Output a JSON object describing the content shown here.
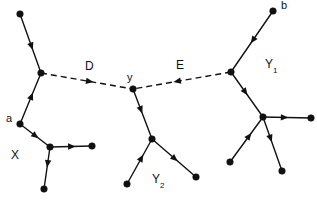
{
  "figure": {
    "type": "graph-diagram",
    "width": 317,
    "height": 202,
    "background_color": "#ffffff",
    "ink_color": "#111111"
  },
  "labels": {
    "bridge_d": "D",
    "bridge_e": "E",
    "node_y": "y",
    "node_a": "a",
    "node_b": "b",
    "region_x": "X",
    "region_y1_base": "Y",
    "region_y1_sub": "1",
    "region_y2_base": "Y",
    "region_y2_sub": "2"
  },
  "nodes": [
    {
      "id": "x_top",
      "name": "node-x-top",
      "x": 20,
      "y": 14
    },
    {
      "id": "x_junction",
      "name": "node-x-junction",
      "x": 41,
      "y": 73
    },
    {
      "id": "a",
      "name": "node-a",
      "x": 20,
      "y": 124
    },
    {
      "id": "x_hub",
      "name": "node-x-hub",
      "x": 50,
      "y": 147
    },
    {
      "id": "x_right",
      "name": "node-x-right",
      "x": 92,
      "y": 146
    },
    {
      "id": "x_bottom",
      "name": "node-x-bottom",
      "x": 44,
      "y": 189
    },
    {
      "id": "y",
      "name": "node-y",
      "x": 133,
      "y": 89
    },
    {
      "id": "y2_hub",
      "name": "node-y2-hub",
      "x": 152,
      "y": 139
    },
    {
      "id": "y2_left",
      "name": "node-y2-left",
      "x": 127,
      "y": 184
    },
    {
      "id": "y2_right",
      "name": "node-y2-right",
      "x": 196,
      "y": 177
    },
    {
      "id": "y1_junction",
      "name": "node-y1-junction",
      "x": 231,
      "y": 72
    },
    {
      "id": "b",
      "name": "node-b",
      "x": 273,
      "y": 11
    },
    {
      "id": "y1_hub",
      "name": "node-y1-hub",
      "x": 263,
      "y": 117
    },
    {
      "id": "y1_right",
      "name": "node-y1-right",
      "x": 311,
      "y": 118
    },
    {
      "id": "y1_bottomleft",
      "name": "node-y1-bottomleft",
      "x": 230,
      "y": 162
    },
    {
      "id": "y1_bottom",
      "name": "node-y1-bottom",
      "x": 282,
      "y": 171
    }
  ],
  "edges": [
    {
      "id": "e_xtop_xjunction",
      "name": "edge-x-top-to-junction",
      "from": "x_top",
      "to": "x_junction",
      "style": "solid",
      "arrow_at": 0.55,
      "arrow_dir": "forward"
    },
    {
      "id": "e_a_xjunction",
      "name": "edge-a-to-x-junction",
      "from": "a",
      "to": "x_junction",
      "style": "solid",
      "arrow_at": 0.55,
      "arrow_dir": "forward"
    },
    {
      "id": "e_a_xhub",
      "name": "edge-a-to-x-hub",
      "from": "a",
      "to": "x_hub",
      "style": "solid",
      "arrow_at": 0.52,
      "arrow_dir": "forward"
    },
    {
      "id": "e_xhub_xright",
      "name": "edge-x-hub-to-right",
      "from": "x_hub",
      "to": "x_right",
      "style": "solid",
      "arrow_at": 0.52,
      "arrow_dir": "forward"
    },
    {
      "id": "e_xhub_xbottom",
      "name": "edge-x-hub-to-bottom",
      "from": "x_hub",
      "to": "x_bottom",
      "style": "solid",
      "arrow_at": 0.4,
      "arrow_dir": "forward"
    },
    {
      "id": "e_bridge_d",
      "name": "edge-bridge-d",
      "from": "x_junction",
      "to": "y",
      "style": "dashed",
      "arrow_at": 0.53,
      "arrow_dir": "forward"
    },
    {
      "id": "e_bridge_e",
      "name": "edge-bridge-e",
      "from": "y1_junction",
      "to": "y",
      "style": "dashed",
      "arrow_at": 0.55,
      "arrow_dir": "forward"
    },
    {
      "id": "e_y_y2hub",
      "name": "edge-y-to-y2-hub",
      "from": "y",
      "to": "y2_hub",
      "style": "solid",
      "arrow_at": 0.42,
      "arrow_dir": "forward"
    },
    {
      "id": "e_y2left_y2hub",
      "name": "edge-y2-left-to-hub",
      "from": "y2_left",
      "to": "y2_hub",
      "style": "solid",
      "arrow_at": 0.58,
      "arrow_dir": "forward"
    },
    {
      "id": "e_y2hub_y2right",
      "name": "edge-y2-hub-to-right",
      "from": "y2_hub",
      "to": "y2_right",
      "style": "solid",
      "arrow_at": 0.52,
      "arrow_dir": "forward"
    },
    {
      "id": "e_b_y1junction",
      "name": "edge-b-to-y1-junction",
      "from": "b",
      "to": "y1_junction",
      "style": "solid",
      "arrow_at": 0.48,
      "arrow_dir": "forward"
    },
    {
      "id": "e_y1junction_y1hub",
      "name": "edge-y1-junction-to-hub",
      "from": "y1_junction",
      "to": "y1_hub",
      "style": "solid",
      "arrow_at": 0.45,
      "arrow_dir": "forward"
    },
    {
      "id": "e_y1hub_y1right",
      "name": "edge-y1-hub-to-right",
      "from": "y1_hub",
      "to": "y1_right",
      "style": "solid",
      "arrow_at": 0.45,
      "arrow_dir": "forward"
    },
    {
      "id": "e_y1bl_y1hub",
      "name": "edge-y1-bottomleft-to-hub",
      "from": "y1_bottomleft",
      "to": "y1_hub",
      "style": "solid",
      "arrow_at": 0.58,
      "arrow_dir": "forward"
    },
    {
      "id": "e_y1hub_y1bottom",
      "name": "edge-y1-hub-to-bottom",
      "from": "y1_hub",
      "to": "y1_bottom",
      "style": "solid",
      "arrow_at": 0.4,
      "arrow_dir": "forward"
    }
  ],
  "label_positions": {
    "bridge_d": {
      "x": 85,
      "y": 60
    },
    "bridge_e": {
      "x": 176,
      "y": 59
    },
    "node_y": {
      "x": 127,
      "y": 72
    },
    "node_a": {
      "x": 6,
      "y": 113
    },
    "node_b": {
      "x": 281,
      "y": 0
    },
    "region_x": {
      "x": 11,
      "y": 149
    },
    "region_y1": {
      "x": 265,
      "y": 58
    },
    "region_y2": {
      "x": 152,
      "y": 173
    }
  }
}
